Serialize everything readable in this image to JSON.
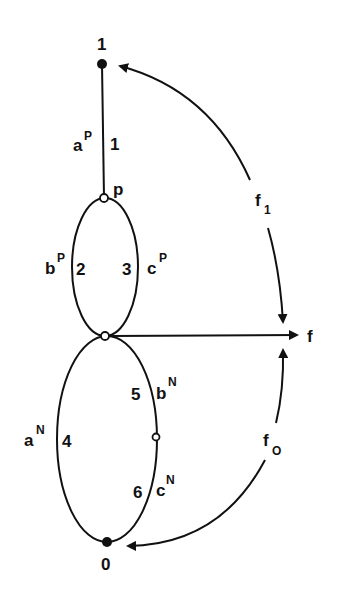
{
  "diagram": {
    "colors": {
      "ink": "#111111",
      "background": "#ffffff"
    },
    "nodes": {
      "n1": {
        "label": "1",
        "type": "filled"
      },
      "p": {
        "label": "p",
        "type": "open"
      },
      "mid": {
        "label": "",
        "type": "open"
      },
      "mid_lower": {
        "label": "",
        "type": "open"
      },
      "n0": {
        "label": "0",
        "type": "filled"
      }
    },
    "edges": {
      "e1": {
        "number": "1",
        "name": "a",
        "superscript": "P"
      },
      "e2": {
        "number": "2",
        "name": "b",
        "superscript": "P"
      },
      "e3": {
        "number": "3",
        "name": "c",
        "superscript": "P"
      },
      "e4": {
        "number": "4",
        "name": "a",
        "superscript": "N"
      },
      "e5": {
        "number": "5",
        "name": "b",
        "superscript": "N"
      },
      "e6": {
        "number": "6",
        "name": "c",
        "superscript": "N"
      }
    },
    "flows": {
      "f": {
        "label": "f"
      },
      "f1": {
        "base": "f",
        "subscript": "1"
      },
      "f0": {
        "base": "f",
        "subscript": "O"
      }
    }
  }
}
